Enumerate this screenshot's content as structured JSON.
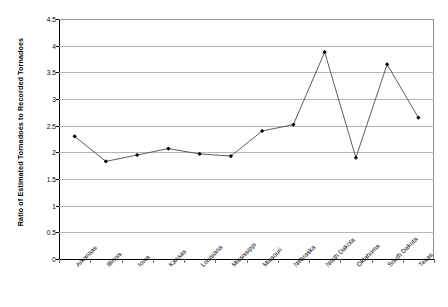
{
  "chart_data": {
    "type": "line",
    "title": "",
    "xlabel": "",
    "ylabel": "Ratio of Estimated Tornadoes to Recorded Tornadoes",
    "categories": [
      "Arkansas",
      "Illinois",
      "Iowa",
      "Kansas",
      "Louisiana",
      "Mississippi",
      "Missouri",
      "Nebraska",
      "North Dakota",
      "Oklahoma",
      "South Dakota",
      "Texas"
    ],
    "values": [
      2.3,
      1.83,
      1.95,
      2.07,
      1.97,
      1.93,
      2.4,
      2.52,
      3.88,
      1.9,
      3.65,
      2.65
    ],
    "ylim": [
      0,
      4.5
    ],
    "yticks": [
      0,
      0.5,
      1,
      1.5,
      2,
      2.5,
      3,
      3.5,
      4,
      4.5
    ],
    "ytick_labels": [
      "0",
      "0.5",
      "1",
      "1.5",
      "2",
      "2.5",
      "3",
      "3.5",
      "4",
      "4.5"
    ],
    "grid": "horizontal",
    "legend": "none",
    "marker": "diamond",
    "series_color": "#4a4a4a",
    "marker_color": "#000000",
    "gridline_color": "#b5b5b5",
    "axis_color": "#000000",
    "background": "#ffffff"
  }
}
